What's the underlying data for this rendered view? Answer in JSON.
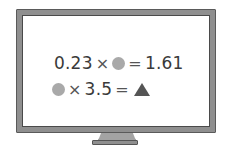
{
  "monitor": {
    "frame_color": "#8f8f8f",
    "screen_color": "#ffffff"
  },
  "equations": [
    {
      "left_number": "0.23",
      "times": "×",
      "unknown": "circle",
      "equals": "=",
      "result": "1.61"
    },
    {
      "unknown": "circle",
      "times": "×",
      "right_number": "3.5",
      "equals": "=",
      "result_symbol": "triangle"
    }
  ],
  "symbols": {
    "circle_color": "#a9a9a9",
    "triangle_color": "#555555"
  }
}
